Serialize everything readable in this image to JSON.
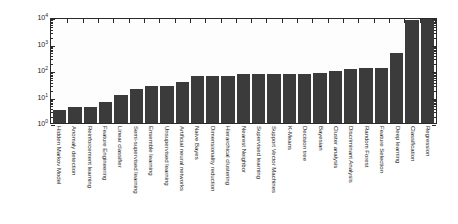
{
  "chart_data": {
    "type": "bar",
    "title": "",
    "xlabel": "",
    "ylabel": "Number of Entries",
    "yscale": "log",
    "ylim": [
      1,
      10000
    ],
    "ytick_labels": [
      "10⁰",
      "10¹",
      "10²",
      "10³",
      "10⁴"
    ],
    "ytick_mantissa": "10",
    "ytick_exponents": [
      "0",
      "1",
      "2",
      "3",
      "4"
    ],
    "grid": false,
    "legend": "none",
    "bar_color": "#3b3b3b",
    "categories": [
      "Hidden Markov Model",
      "Anomaly detection",
      "Reinforcement learning",
      "Feature Engineering",
      "Linear classifier",
      "Semi-supervised learning",
      "Ensemble learning",
      "Unsupervised learning",
      "Artificial neural networks",
      "Naive Bayes",
      "Dimensionality reduction",
      "Hierarchical clustering",
      "Nearest Neighbor",
      "Supervised learning",
      "Support Vector Machines",
      "K-Means",
      "Decision tree",
      "Bayesian",
      "Cluster analysis",
      "Discriminant Analysis",
      "Random Forest",
      "Feature Selection",
      "Deep learning",
      "Classification",
      "Regression"
    ],
    "values": [
      3,
      4,
      4,
      6,
      11,
      20,
      26,
      26,
      35,
      60,
      62,
      62,
      68,
      70,
      70,
      72,
      72,
      80,
      95,
      110,
      115,
      120,
      430,
      7800,
      8200
    ]
  }
}
